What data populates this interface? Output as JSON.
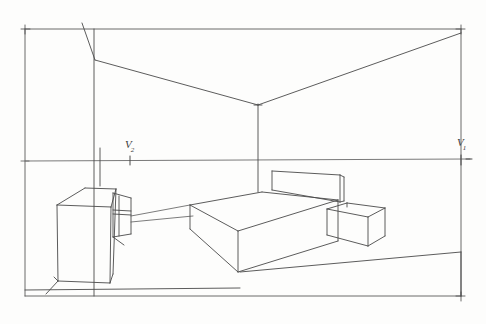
{
  "document": {
    "kind": "hand-drawn-sketch",
    "subject": "two-point perspective bedroom interior",
    "medium": "pencil on paper",
    "background_color": "#fdfdfc",
    "ink_color": "#4a4a4a"
  },
  "annotations": {
    "vanishing_point_right": {
      "label_main": "V",
      "label_sub": "1",
      "x": 461,
      "y": 160
    },
    "vanishing_point_left": {
      "label_main": "V",
      "label_sub": "2",
      "x": 130,
      "y": 161
    },
    "horizon_line": {
      "name": "horizon-line",
      "y_left": 161,
      "y_right": 159
    }
  },
  "drawing": {
    "frame": {
      "name": "page-border-frame",
      "left": 25,
      "top": 29,
      "right": 461,
      "bottom": 296
    },
    "room": {
      "back_wall_corner_x": 258,
      "ceiling_corner_y": 105,
      "left_wall_edge_x": 94,
      "ceiling_break_y": 60
    },
    "objects": [
      {
        "name": "wardrobe-dresser",
        "position": "left wall"
      },
      {
        "name": "dresser-side-drawer-box",
        "position": "right face of dresser"
      },
      {
        "name": "bed",
        "position": "center floor"
      },
      {
        "name": "bed-headboard",
        "position": "back of bed"
      },
      {
        "name": "nightstand",
        "position": "right of bed"
      }
    ]
  }
}
